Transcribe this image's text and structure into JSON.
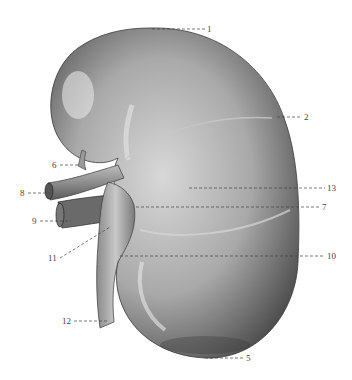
{
  "figure": {
    "labels": [
      {
        "id": "1",
        "text": "1",
        "x": 207,
        "y": 25,
        "pointer": [
          152,
          29
        ]
      },
      {
        "id": "2",
        "text": "2",
        "x": 304,
        "y": 112,
        "pointer": [
          277,
          117
        ]
      },
      {
        "id": "13",
        "text": "13",
        "x": 327,
        "y": 183,
        "pointer": [
          189,
          188
        ]
      },
      {
        "id": "7",
        "text": "7",
        "x": 322,
        "y": 202,
        "pointer": [
          136,
          207
        ]
      },
      {
        "id": "10",
        "text": "10",
        "x": 327,
        "y": 251,
        "pointer": [
          120,
          256
        ]
      },
      {
        "id": "5",
        "text": "5",
        "x": 246,
        "y": 354,
        "pointer": [
          205,
          358
        ]
      },
      {
        "id": "6",
        "text": "6",
        "x": 52,
        "y": 160,
        "pointer": [
          80,
          165
        ]
      },
      {
        "id": "8",
        "text": "8",
        "x": 20,
        "y": 188,
        "pointer": [
          50,
          193
        ]
      },
      {
        "id": "9",
        "text": "9",
        "x": 32,
        "y": 216,
        "pointer": [
          71,
          221
        ]
      },
      {
        "id": "11",
        "text": "11",
        "x": 48,
        "y": 253,
        "pointer": [
          110,
          227
        ]
      },
      {
        "id": "12",
        "text": "12",
        "x": 62,
        "y": 316,
        "pointer": [
          107,
          321
        ]
      }
    ]
  }
}
